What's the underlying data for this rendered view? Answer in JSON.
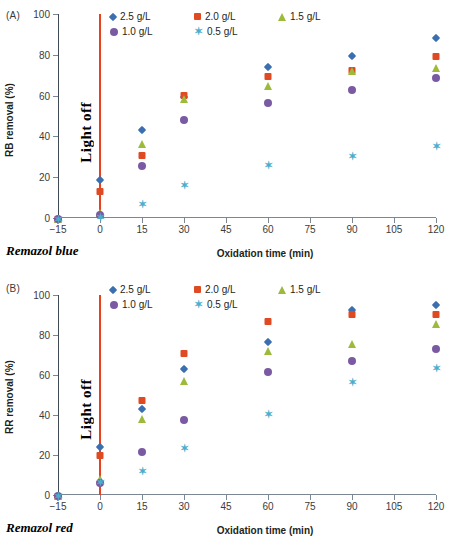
{
  "figure": {
    "axis_title_x": "Oxidation time (min)",
    "light_off_label": "Light off"
  },
  "series_defs": [
    {
      "key": "s25",
      "name": "2.5 g/L",
      "marker": "diamond",
      "color": "#3C6FAF"
    },
    {
      "key": "s20",
      "name": "2.0 g/L",
      "marker": "square",
      "color": "#E04A23"
    },
    {
      "key": "s15",
      "name": "1.5 g/L",
      "marker": "triangle",
      "color": "#9CBB3B"
    },
    {
      "key": "s10",
      "name": "1.0 g/L",
      "marker": "circle",
      "color": "#7A5AA2"
    },
    {
      "key": "s05",
      "name": "0.5 g/L",
      "marker": "star",
      "color": "#49AFCD"
    }
  ],
  "panelA": {
    "tag": "(A)",
    "dye_name": "Remazol blue",
    "ylabel": "RB removal (%)",
    "xlabel": "Oxidation time (min)"
  },
  "panelB": {
    "tag": "(B)",
    "dye_name": "Remazol red",
    "ylabel": "RR removal (%)",
    "xlabel": "Oxidation time (min)"
  },
  "chart_data": [
    {
      "type": "scatter",
      "title": "(A) Remazol blue",
      "xlabel": "Oxidation time (min)",
      "ylabel": "RB removal (%)",
      "xlim": [
        -15,
        120
      ],
      "ylim": [
        0,
        100
      ],
      "xticks": [
        -15,
        0,
        15,
        30,
        45,
        60,
        75,
        90,
        105,
        120
      ],
      "yticks": [
        0,
        20,
        40,
        60,
        80,
        100
      ],
      "grid": false,
      "legend_position": "top",
      "annotations": [
        {
          "text": "Light off",
          "x": 0,
          "type": "vertical-line",
          "color": "#e8411c"
        }
      ],
      "x": [
        -15,
        0,
        15,
        30,
        60,
        90,
        120
      ],
      "series": [
        {
          "name": "2.5 g/L",
          "marker": "diamond",
          "color": "#3C6FAF",
          "values": [
            0,
            19.7,
            44.0,
            60.5,
            75.0,
            80.2,
            89.0
          ]
        },
        {
          "name": "2.0 g/L",
          "marker": "square",
          "color": "#E04A23",
          "values": [
            0,
            13.5,
            31.2,
            60.8,
            70.0,
            72.8,
            79.7
          ]
        },
        {
          "name": "1.5 g/L",
          "marker": "triangle",
          "color": "#9CBB3B",
          "values": [
            0,
            2.8,
            37.0,
            58.8,
            65.0,
            72.5,
            74.0
          ]
        },
        {
          "name": "1.0 g/L",
          "marker": "circle",
          "color": "#7A5AA2",
          "values": [
            0,
            1.8,
            26.0,
            48.3,
            56.7,
            63.2,
            69.3
          ]
        },
        {
          "name": "0.5 g/L",
          "marker": "star",
          "color": "#49AFCD",
          "values": [
            0,
            0.8,
            7.3,
            16.8,
            26.5,
            31.0,
            35.8
          ]
        }
      ]
    },
    {
      "type": "scatter",
      "title": "(B) Remazol red",
      "xlabel": "Oxidation time (min)",
      "ylabel": "RR removal (%)",
      "xlim": [
        -15,
        120
      ],
      "ylim": [
        0,
        100
      ],
      "xticks": [
        -15,
        0,
        15,
        30,
        45,
        60,
        75,
        90,
        105,
        120
      ],
      "yticks": [
        0,
        20,
        40,
        60,
        80,
        100
      ],
      "grid": false,
      "legend_position": "top",
      "annotations": [
        {
          "text": "Light off",
          "x": 0,
          "type": "vertical-line",
          "color": "#e8411c"
        }
      ],
      "x": [
        -15,
        0,
        15,
        30,
        60,
        90,
        120
      ],
      "series": [
        {
          "name": "2.5 g/L",
          "marker": "diamond",
          "color": "#3C6FAF",
          "values": [
            0,
            25.2,
            44.2,
            64.0,
            77.7,
            93.7,
            96.0
          ]
        },
        {
          "name": "2.0 g/L",
          "marker": "square",
          "color": "#E04A23",
          "values": [
            0,
            20.5,
            47.8,
            71.5,
            87.5,
            90.8,
            90.8
          ]
        },
        {
          "name": "1.5 g/L",
          "marker": "triangle",
          "color": "#9CBB3B",
          "values": [
            0,
            8.6,
            38.5,
            57.3,
            72.7,
            76.0,
            86.0
          ]
        },
        {
          "name": "1.0 g/L",
          "marker": "circle",
          "color": "#7A5AA2",
          "values": [
            0,
            6.3,
            21.8,
            37.9,
            62.0,
            67.5,
            73.5
          ]
        },
        {
          "name": "0.5 g/L",
          "marker": "star",
          "color": "#49AFCD",
          "values": [
            0,
            7.2,
            12.3,
            23.8,
            41.2,
            57.2,
            64.0
          ]
        }
      ]
    }
  ]
}
